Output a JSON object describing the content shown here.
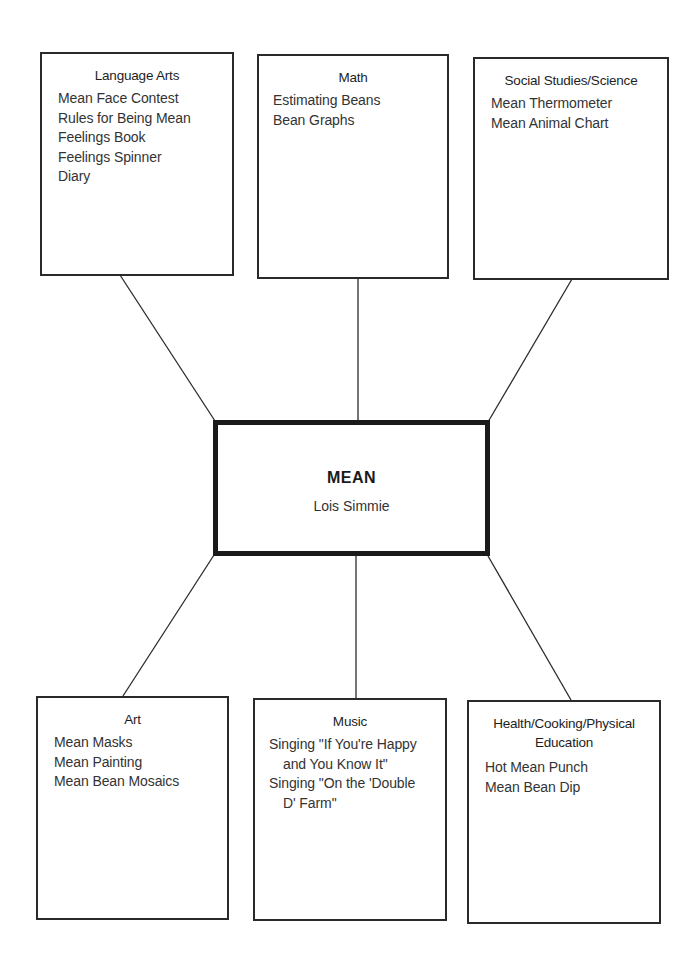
{
  "center": {
    "title": "MEAN",
    "author": "Lois Simmie"
  },
  "boxes": {
    "language_arts": {
      "title": "Language Arts",
      "items": [
        "Mean Face Contest",
        "Rules for Being Mean",
        "Feelings Book",
        "Feelings Spinner",
        "Diary"
      ]
    },
    "math": {
      "title": "Math",
      "items": [
        "Estimating Beans",
        "Bean Graphs"
      ]
    },
    "social_studies": {
      "title": "Social Studies/Science",
      "items": [
        "Mean Thermometer",
        "Mean Animal Chart"
      ]
    },
    "art": {
      "title": "Art",
      "items": [
        "Mean Masks",
        "Mean Painting",
        "Mean Bean Mosaics"
      ]
    },
    "music": {
      "title": "Music",
      "items": [
        {
          "line1": "Singing \"If You're Happy",
          "line2": "and You Know It\""
        },
        {
          "line1": "Singing \"On the 'Double",
          "line2": "D' Farm\""
        }
      ]
    },
    "health": {
      "title_line1": "Health/Cooking/Physical",
      "title_line2": "Education",
      "items": [
        "Hot Mean Punch",
        "Mean Bean Dip"
      ]
    }
  },
  "colors": {
    "line": "#2a2a2a",
    "center_border": "#1a1a1a",
    "background": "#ffffff"
  }
}
